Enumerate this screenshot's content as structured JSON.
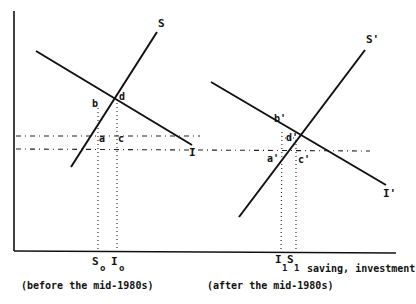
{
  "diagram": {
    "left_panel": {
      "caption": "(before the mid-1980s)",
      "curves": {
        "saving": {
          "label": "S",
          "x1": 71,
          "y1": 167,
          "x2": 157,
          "y2": 32
        },
        "investment": {
          "label": "I",
          "x1": 36,
          "y1": 51,
          "x2": 192,
          "y2": 145
        }
      },
      "points": {
        "b": "b",
        "d": "d",
        "a": "a",
        "c": "c"
      },
      "axis_labels": {
        "s0_main": "S",
        "s0_sub": "o",
        "i0_main": "I",
        "i0_sub": "o"
      }
    },
    "right_panel": {
      "caption": "(after the mid-1980s)",
      "curves": {
        "saving": {
          "label": "S'",
          "x1": 239,
          "y1": 217,
          "x2": 365,
          "y2": 50
        },
        "investment": {
          "label": "I'",
          "x1": 211,
          "y1": 82,
          "x2": 386,
          "y2": 185
        }
      },
      "points": {
        "b": "b'",
        "d": "d'",
        "a": "a'",
        "c": "c'"
      },
      "axis_labels": {
        "i1_main": "I",
        "i1_sub": "1",
        "s1_main": "S",
        "s1_sub": "1"
      }
    },
    "x_axis_label": "saving, investment"
  }
}
